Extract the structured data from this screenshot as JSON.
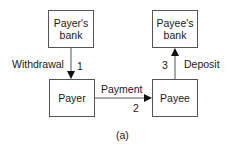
{
  "diagram": {
    "nodes": [
      {
        "id": "payers-bank",
        "label": "Payer's bank",
        "line1": "Payer's",
        "line2": "bank"
      },
      {
        "id": "payees-bank",
        "label": "Payee's bank",
        "line1": "Payee's",
        "line2": "bank"
      },
      {
        "id": "payer",
        "label": "Payer"
      },
      {
        "id": "payee",
        "label": "Payee"
      }
    ],
    "edges": [
      {
        "from": "payers-bank",
        "to": "payer",
        "label": "Withdrawal",
        "step": "1"
      },
      {
        "from": "payer",
        "to": "payee",
        "label": "Payment",
        "step": "2"
      },
      {
        "from": "payee",
        "to": "payees-bank",
        "label": "Deposit",
        "step": "3"
      }
    ],
    "caption": "(a)",
    "colors": {
      "stroke": "#555555",
      "text": "#1a1a1a",
      "background": "#ffffff"
    }
  }
}
